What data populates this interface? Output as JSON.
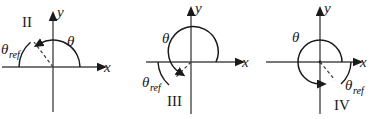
{
  "figure": {
    "background_color": "#ffffff",
    "stroke_color": "#1a1a1a",
    "panel_count": 3
  },
  "common": {
    "axis_label_x": "x",
    "axis_label_y": "y",
    "angle_label": "θ",
    "theta_symbol": "θ",
    "ref_subscript": "ref"
  },
  "panels": [
    {
      "id": "panel-quadrant-2",
      "quadrant_label": "II",
      "angle_label": "θ",
      "ref_angle_theta": "θ",
      "ref_angle_sub": "ref",
      "axis_x_label": "x",
      "axis_y_label": "y",
      "description": "Terminal ray in quadrant II; theta arc from positive x-axis counterclockwise, reference angle measured from negative x-axis"
    },
    {
      "id": "panel-quadrant-3",
      "quadrant_label": "III",
      "angle_label": "θ",
      "ref_angle_theta": "θ",
      "ref_angle_sub": "ref",
      "axis_x_label": "x",
      "axis_y_label": "y",
      "description": "Terminal ray in quadrant III; theta arc from positive x-axis counterclockwise past 180 degrees, reference angle measured from negative x-axis"
    },
    {
      "id": "panel-quadrant-4",
      "quadrant_label": "IV",
      "angle_label": "θ",
      "ref_angle_theta": "θ",
      "ref_angle_sub": "ref",
      "axis_x_label": "x",
      "axis_y_label": "y",
      "description": "Terminal ray in quadrant IV; theta arc nearly full revolution counterclockwise, reference angle measured from positive x-axis"
    }
  ]
}
